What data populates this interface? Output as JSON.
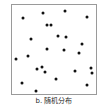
{
  "chart_data": {
    "type": "scatter",
    "title": "",
    "subtitle": "",
    "caption": "b. 随机分布",
    "panel_label": "b",
    "panel_title": "随机分布",
    "xlabel": "",
    "ylabel": "",
    "xlim": [
      0,
      86
    ],
    "ylim": [
      0,
      91
    ],
    "grid": false,
    "legend": null,
    "axis_ticks": [],
    "tick_labels": [],
    "marker": {
      "shape": "circle",
      "color": "#111111",
      "size_px": 3
    },
    "frame": {
      "border_color": "#9a9a9a",
      "background": "#ffffff",
      "x_px": 11,
      "y_px": 4,
      "width_px": 86,
      "height_px": 91
    },
    "n_points": 24,
    "points": [
      {
        "x": 11,
        "y": 13
      },
      {
        "x": 31,
        "y": 8
      },
      {
        "x": 35,
        "y": 20
      },
      {
        "x": 39,
        "y": 20
      },
      {
        "x": 53,
        "y": 6
      },
      {
        "x": 75,
        "y": 12
      },
      {
        "x": 19,
        "y": 34
      },
      {
        "x": 46,
        "y": 31
      },
      {
        "x": 54,
        "y": 32
      },
      {
        "x": 35,
        "y": 44
      },
      {
        "x": 52,
        "y": 45
      },
      {
        "x": 70,
        "y": 39
      },
      {
        "x": 16,
        "y": 51
      },
      {
        "x": 4,
        "y": 54
      },
      {
        "x": 67,
        "y": 48
      },
      {
        "x": 25,
        "y": 64
      },
      {
        "x": 30,
        "y": 62
      },
      {
        "x": 33,
        "y": 67
      },
      {
        "x": 63,
        "y": 66
      },
      {
        "x": 79,
        "y": 63
      },
      {
        "x": 80,
        "y": 68
      },
      {
        "x": 10,
        "y": 78
      },
      {
        "x": 44,
        "y": 74
      },
      {
        "x": 24,
        "y": 86
      },
      {
        "x": 75,
        "y": 80
      }
    ]
  },
  "figure": {
    "caption_text": "b. 随机分布"
  }
}
